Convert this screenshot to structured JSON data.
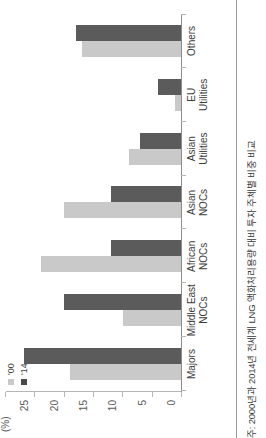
{
  "chart_data": {
    "type": "bar",
    "title": "",
    "subtitle": "",
    "xlabel": "",
    "ylabel": "(%)",
    "ylim": [
      0,
      30
    ],
    "yticks": [
      0,
      5,
      10,
      15,
      20,
      25,
      30
    ],
    "grid": false,
    "legend_position": "top-left",
    "orientation": "rotated-90-ccw",
    "categories": [
      "Majors",
      "Middle East NOCs",
      "African NOCs",
      "Asian NOCs",
      "Asian Utilities",
      "EU Utilities",
      "Others"
    ],
    "category_lines": [
      [
        "Majors",
        ""
      ],
      [
        "Middle East",
        "NOCs"
      ],
      [
        "African",
        "NOCs"
      ],
      [
        "Asian",
        "NOCs"
      ],
      [
        "Asian",
        "Utilities"
      ],
      [
        "EU",
        "Utilities"
      ],
      [
        "Others",
        ""
      ]
    ],
    "series": [
      {
        "name": "'00",
        "color": "#c9c9c9",
        "values": [
          19,
          10,
          24,
          20,
          9,
          1,
          17
        ]
      },
      {
        "name": "'14",
        "color": "#5b5b5b",
        "values": [
          27,
          20,
          12,
          12,
          7,
          4,
          18
        ]
      }
    ]
  },
  "legend": {
    "items": [
      {
        "label": "'00",
        "color": "#c9c9c9"
      },
      {
        "label": "'14",
        "color": "#5b5b5b"
      }
    ]
  },
  "axis": {
    "unit_label": "(%)",
    "tick_labels": [
      "30",
      "25",
      "20",
      "15",
      "10",
      "5",
      "0"
    ]
  },
  "footnote": {
    "text": "주: 2000년과 2014년 전세계 LNG 액화처리용량 대비 투자 주체별 비중 비교"
  },
  "colors": {
    "series_00": "#c9c9c9",
    "series_14": "#5b5b5b",
    "axis": "#b5b5b5",
    "text": "#3c3c3c"
  }
}
